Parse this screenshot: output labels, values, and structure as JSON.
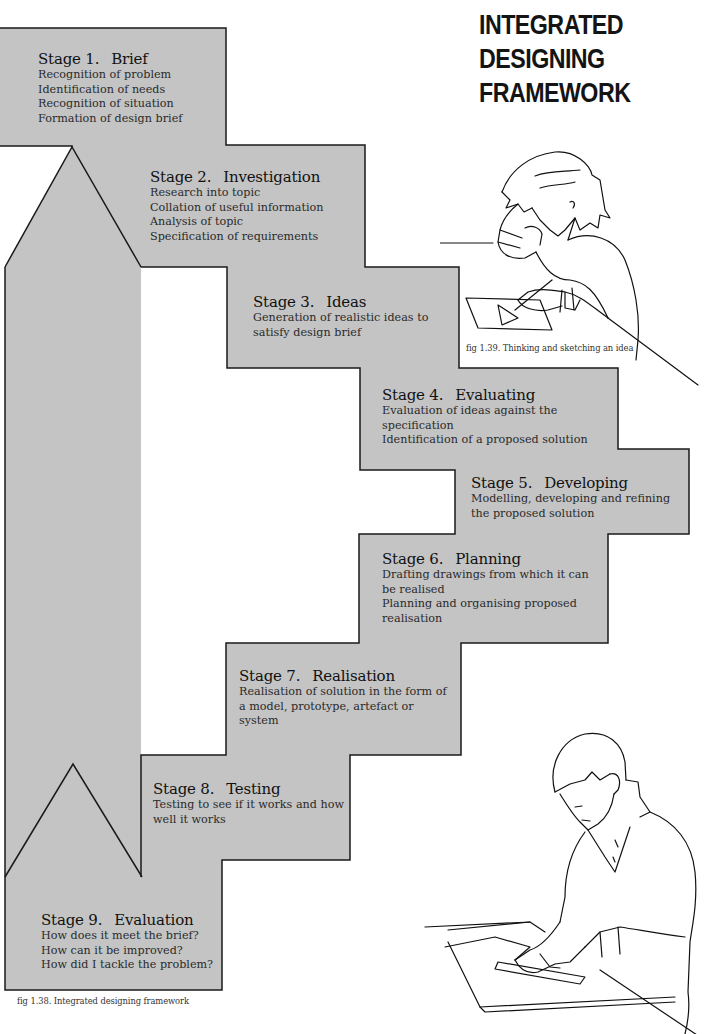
{
  "title": {
    "lines": [
      "INTEGRATED",
      "DESIGNING",
      "FRAMEWORK"
    ]
  },
  "colors": {
    "fill": "#c4c4c4",
    "outline": "#1a1a1a",
    "background": "#ffffff"
  },
  "stages": [
    {
      "number": "Stage 1.",
      "name": "Brief",
      "lines": [
        "Recognition of problem",
        "Identification of needs",
        "Recognition of situation",
        "Formation of design brief"
      ]
    },
    {
      "number": "Stage 2.",
      "name": "Investigation",
      "lines": [
        "Research into topic",
        "Collation of useful information",
        "Analysis of topic",
        "Specification of requirements"
      ]
    },
    {
      "number": "Stage 3.",
      "name": "Ideas",
      "lines": [
        "Generation of realistic ideas to",
        "satisfy design brief"
      ]
    },
    {
      "number": "Stage 4.",
      "name": "Evaluating",
      "lines": [
        "Evaluation of ideas against the",
        "specification",
        "Identification of a proposed solution"
      ]
    },
    {
      "number": "Stage 5.",
      "name": "Developing",
      "lines": [
        "Modelling, developing and refining",
        "the proposed solution"
      ]
    },
    {
      "number": "Stage 6.",
      "name": "Planning",
      "lines": [
        "Drafting drawings from which it can",
        "be realised",
        "Planning and organising proposed",
        "realisation"
      ]
    },
    {
      "number": "Stage 7.",
      "name": "Realisation",
      "lines": [
        "Realisation of solution in the form of",
        "a model, prototype, artefact or",
        "system"
      ]
    },
    {
      "number": "Stage 8.",
      "name": "Testing",
      "lines": [
        "Testing to see if it works and how",
        "well it works"
      ]
    },
    {
      "number": "Stage 9.",
      "name": "Evaluation",
      "lines": [
        "How does it meet the brief?",
        "How can it be improved?",
        "How did I tackle the problem?"
      ]
    }
  ],
  "captions": {
    "fig_1_39": "fig 1.39. Thinking and sketching an idea",
    "fig_1_38": "fig 1.38. Integrated designing framework"
  },
  "illustrations": {
    "thinking": "person-thinking-sketching-illustration",
    "drawing": "person-drawing-with-ruler-illustration"
  }
}
